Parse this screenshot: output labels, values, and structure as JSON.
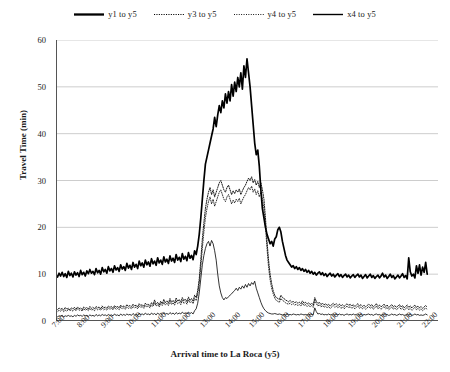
{
  "chart_data": {
    "type": "line",
    "title": "",
    "xlabel": "Arrival time to La Roca (y5)",
    "ylabel": "Travel Time (min)",
    "xlim": [
      7,
      22.5
    ],
    "ylim": [
      0,
      60
    ],
    "yticks": [
      0,
      10,
      20,
      30,
      40,
      50,
      60
    ],
    "xticks": [
      "7:00",
      "8:00",
      "9:00",
      "10:00",
      "11:00",
      "12:00",
      "13:00",
      "14:00",
      "15:00",
      "16:00",
      "17:00",
      "18:00",
      "19:00",
      "20:00",
      "21:00",
      "22:00"
    ],
    "grid": "horizontal",
    "legend_position": "top-center",
    "x_start": 7.0,
    "x_step": 0.0625,
    "series": [
      {
        "name": "y1 to y5",
        "style": "solid-thick",
        "color": "#000000",
        "values": [
          9.8,
          9.4,
          10.2,
          9.6,
          10.4,
          9.5,
          10.1,
          9.3,
          10.6,
          9.7,
          10.2,
          9.4,
          10.5,
          9.8,
          10.3,
          9.5,
          10.8,
          9.9,
          10.4,
          9.6,
          10.7,
          10.1,
          11.0,
          10.2,
          10.6,
          9.9,
          11.2,
          10.3,
          10.8,
          10.0,
          11.4,
          10.5,
          11.0,
          10.2,
          11.6,
          10.7,
          11.2,
          10.4,
          11.8,
          10.9,
          11.4,
          10.6,
          12.0,
          11.1,
          11.6,
          10.8,
          12.3,
          11.3,
          11.9,
          11.0,
          12.5,
          11.5,
          12.1,
          11.2,
          12.8,
          11.8,
          12.4,
          11.5,
          13.0,
          12.0,
          12.6,
          11.7,
          13.3,
          12.2,
          12.8,
          11.9,
          13.5,
          12.4,
          13.0,
          12.1,
          13.7,
          12.6,
          13.2,
          12.3,
          13.9,
          12.8,
          13.4,
          12.5,
          14.2,
          13.0,
          13.6,
          12.7,
          14.4,
          13.2,
          13.8,
          12.9,
          14.6,
          13.4,
          14.0,
          13.1,
          15.0,
          14.2,
          16.0,
          18.5,
          22.0,
          26.0,
          30.0,
          33.5,
          35.0,
          36.5,
          38.0,
          39.5,
          41.0,
          43.5,
          41.5,
          44.0,
          46.0,
          44.5,
          47.0,
          45.5,
          48.5,
          46.5,
          49.0,
          47.0,
          50.5,
          48.0,
          51.0,
          49.0,
          52.0,
          50.0,
          53.0,
          49.5,
          54.5,
          52.0,
          56.0,
          53.0,
          50.0,
          46.0,
          42.0,
          38.0,
          35.5,
          36.5,
          33.0,
          28.0,
          24.0,
          22.0,
          20.0,
          18.5,
          17.5,
          16.5,
          17.0,
          16.0,
          17.5,
          18.0,
          19.5,
          20.0,
          19.0,
          17.0,
          15.5,
          14.0,
          13.0,
          12.5,
          12.0,
          11.5,
          11.8,
          11.2,
          11.6,
          11.0,
          11.4,
          10.8,
          11.2,
          10.6,
          11.0,
          10.4,
          10.8,
          10.2,
          10.6,
          10.0,
          10.4,
          9.8,
          10.2,
          10.5,
          9.9,
          10.3,
          9.7,
          10.1,
          9.5,
          9.9,
          10.2,
          9.6,
          10.0,
          9.4,
          9.8,
          10.1,
          9.5,
          9.9,
          9.3,
          9.7,
          10.0,
          9.4,
          9.8,
          9.2,
          9.6,
          9.9,
          9.3,
          9.7,
          10.0,
          9.4,
          9.8,
          9.1,
          9.5,
          9.9,
          9.2,
          9.6,
          10.0,
          9.3,
          9.7,
          9.1,
          9.5,
          9.8,
          9.2,
          9.6,
          10.2,
          9.4,
          9.8,
          9.1,
          9.5,
          10.0,
          9.3,
          9.7,
          9.0,
          9.4,
          9.8,
          9.2,
          9.6,
          10.1,
          9.3,
          9.7,
          9.0,
          13.5,
          10.5,
          9.6,
          10.0,
          9.2,
          11.8,
          10.2,
          12.0,
          9.8,
          11.5,
          10.4,
          12.5,
          10.0
        ]
      },
      {
        "name": "y3 to y5",
        "style": "dotted",
        "color": "#000000",
        "values": [
          2.6,
          2.4,
          2.8,
          2.5,
          2.7,
          2.3,
          2.9,
          2.5,
          2.7,
          2.4,
          2.8,
          2.6,
          2.9,
          2.5,
          3.0,
          2.6,
          2.8,
          2.4,
          3.0,
          2.7,
          2.9,
          2.5,
          3.1,
          2.7,
          2.9,
          2.6,
          3.1,
          2.8,
          3.0,
          2.6,
          3.2,
          2.8,
          3.0,
          2.7,
          3.2,
          2.9,
          3.1,
          2.7,
          3.3,
          2.9,
          3.1,
          2.8,
          3.4,
          3.0,
          3.2,
          2.9,
          3.5,
          3.1,
          3.3,
          3.0,
          3.6,
          3.2,
          3.4,
          3.0,
          3.7,
          3.3,
          3.5,
          3.1,
          3.8,
          3.4,
          3.6,
          3.2,
          3.9,
          3.5,
          4.5,
          3.6,
          4.0,
          3.4,
          4.2,
          3.7,
          4.6,
          3.9,
          4.3,
          3.8,
          4.8,
          4.0,
          4.4,
          3.9,
          4.9,
          4.2,
          4.6,
          4.0,
          5.0,
          4.3,
          4.7,
          4.1,
          5.1,
          4.4,
          4.8,
          4.2,
          5.5,
          5.0,
          6.5,
          9.0,
          13.0,
          17.5,
          21.0,
          24.0,
          26.0,
          27.5,
          28.5,
          27.0,
          28.0,
          26.5,
          27.5,
          28.5,
          29.5,
          30.0,
          29.0,
          28.0,
          27.5,
          28.5,
          29.0,
          28.0,
          27.0,
          27.8,
          27.2,
          28.0,
          27.5,
          28.2,
          27.0,
          27.8,
          28.5,
          29.0,
          29.8,
          30.5,
          30.0,
          30.8,
          29.5,
          30.2,
          29.0,
          29.8,
          28.5,
          29.5,
          28.0,
          26.0,
          22.0,
          17.0,
          13.0,
          10.0,
          8.0,
          6.5,
          5.5,
          5.0,
          4.8,
          4.6,
          5.5,
          5.0,
          4.8,
          4.5,
          4.3,
          4.1,
          4.4,
          4.0,
          4.2,
          3.9,
          4.1,
          3.8,
          4.0,
          3.7,
          4.3,
          3.8,
          4.0,
          3.6,
          3.9,
          3.5,
          3.8,
          3.4,
          5.0,
          4.2,
          3.7,
          4.0,
          3.5,
          3.8,
          3.4,
          3.7,
          3.3,
          3.6,
          3.2,
          3.5,
          3.8,
          3.4,
          3.7,
          3.3,
          3.6,
          3.2,
          3.5,
          3.1,
          3.4,
          3.7,
          3.3,
          3.6,
          3.2,
          3.5,
          3.1,
          3.4,
          3.7,
          3.2,
          3.5,
          3.1,
          3.4,
          3.0,
          3.3,
          3.6,
          3.2,
          3.5,
          3.0,
          3.3,
          3.7,
          3.1,
          3.4,
          3.0,
          3.3,
          3.6,
          3.1,
          3.4,
          2.9,
          3.2,
          3.5,
          3.0,
          3.3,
          2.9,
          3.2,
          3.5,
          3.0,
          3.3,
          2.8,
          3.1,
          3.4,
          2.9,
          3.2,
          2.8,
          3.1,
          3.4,
          2.9,
          3.2,
          2.8,
          3.1,
          2.7,
          3.0,
          3.3,
          2.9
        ]
      },
      {
        "name": "y4 to y5",
        "style": "dotted-fine",
        "color": "#000000",
        "values": [
          2.2,
          2.0,
          2.3,
          2.1,
          2.4,
          2.0,
          2.3,
          2.1,
          2.5,
          2.2,
          2.4,
          2.1,
          2.5,
          2.2,
          2.6,
          2.3,
          2.4,
          2.1,
          2.6,
          2.3,
          2.5,
          2.2,
          2.7,
          2.3,
          2.5,
          2.2,
          2.7,
          2.4,
          2.6,
          2.3,
          2.8,
          2.4,
          2.6,
          2.3,
          2.8,
          2.5,
          2.7,
          2.4,
          2.9,
          2.5,
          2.7,
          2.4,
          3.0,
          2.6,
          2.8,
          2.5,
          3.0,
          2.7,
          2.9,
          2.6,
          3.1,
          2.8,
          3.0,
          2.6,
          3.2,
          2.9,
          3.1,
          2.7,
          3.3,
          3.0,
          3.2,
          2.8,
          3.4,
          3.1,
          3.9,
          3.2,
          3.5,
          3.0,
          3.7,
          3.3,
          4.0,
          3.4,
          3.8,
          3.3,
          4.2,
          3.5,
          3.9,
          3.4,
          4.3,
          3.7,
          4.0,
          3.5,
          4.4,
          3.8,
          4.1,
          3.6,
          4.5,
          3.9,
          4.2,
          3.7,
          4.8,
          4.4,
          5.8,
          8.0,
          11.5,
          15.5,
          19.0,
          22.0,
          24.0,
          25.5,
          26.5,
          25.0,
          26.0,
          24.5,
          25.5,
          26.5,
          27.5,
          28.0,
          27.0,
          26.0,
          25.5,
          26.5,
          27.0,
          26.0,
          25.0,
          25.8,
          25.2,
          26.0,
          25.5,
          26.2,
          25.0,
          25.8,
          26.5,
          27.0,
          27.8,
          28.5,
          28.0,
          28.8,
          27.5,
          28.2,
          27.0,
          27.8,
          26.5,
          27.5,
          26.0,
          24.0,
          20.0,
          15.5,
          11.5,
          8.8,
          7.0,
          5.8,
          4.9,
          4.4,
          4.2,
          4.0,
          4.8,
          4.4,
          4.2,
          3.9,
          3.7,
          3.6,
          3.8,
          3.5,
          3.7,
          3.4,
          3.6,
          3.3,
          3.5,
          3.2,
          3.8,
          3.3,
          3.5,
          3.1,
          3.4,
          3.0,
          3.3,
          2.9,
          4.4,
          3.7,
          3.2,
          3.5,
          3.0,
          3.3,
          2.9,
          3.2,
          2.8,
          3.1,
          2.7,
          3.0,
          3.3,
          2.9,
          3.2,
          2.8,
          3.1,
          2.7,
          3.0,
          2.6,
          2.9,
          3.2,
          2.8,
          3.1,
          2.7,
          3.0,
          2.6,
          2.9,
          3.2,
          2.7,
          3.0,
          2.6,
          2.9,
          2.5,
          2.8,
          3.1,
          2.7,
          3.0,
          2.5,
          2.8,
          3.2,
          2.6,
          2.9,
          2.5,
          2.8,
          3.1,
          2.6,
          2.9,
          2.4,
          2.7,
          3.0,
          2.5,
          2.8,
          2.4,
          2.7,
          3.0,
          2.5,
          2.8,
          2.3,
          2.6,
          2.9,
          2.4,
          2.7,
          2.3,
          2.6,
          2.9,
          2.4,
          2.7,
          2.3,
          2.6,
          2.2,
          2.5,
          2.8,
          2.4
        ]
      },
      {
        "name": "x4 to y5",
        "style": "solid-thin",
        "color": "#000000",
        "values": [
          1.0,
          0.9,
          1.1,
          1.0,
          1.2,
          0.9,
          1.1,
          1.0,
          1.2,
          1.0,
          1.1,
          0.9,
          1.2,
          1.0,
          1.3,
          1.1,
          1.2,
          1.0,
          1.3,
          1.1,
          1.2,
          1.0,
          1.3,
          1.1,
          1.2,
          1.0,
          1.4,
          1.1,
          1.3,
          1.1,
          1.4,
          1.2,
          1.3,
          1.1,
          1.4,
          1.2,
          1.3,
          1.1,
          1.5,
          1.2,
          1.3,
          1.1,
          1.5,
          1.2,
          1.4,
          1.2,
          1.5,
          1.3,
          1.4,
          1.2,
          1.6,
          1.3,
          1.5,
          1.2,
          1.6,
          1.4,
          1.5,
          1.3,
          1.7,
          1.4,
          1.5,
          1.3,
          1.7,
          1.4,
          1.6,
          1.3,
          1.7,
          1.4,
          1.6,
          1.4,
          1.8,
          1.5,
          1.6,
          1.4,
          1.8,
          1.5,
          1.7,
          1.4,
          1.8,
          1.5,
          1.7,
          1.5,
          1.9,
          1.6,
          1.7,
          1.5,
          1.9,
          1.6,
          1.8,
          1.5,
          2.2,
          2.6,
          3.8,
          6.0,
          9.0,
          12.0,
          14.0,
          15.5,
          16.5,
          17.0,
          16.0,
          17.2,
          16.5,
          15.0,
          13.0,
          10.0,
          7.5,
          6.0,
          5.0,
          4.5,
          5.0,
          4.8,
          5.2,
          5.5,
          5.8,
          6.2,
          6.5,
          7.0,
          6.5,
          7.2,
          6.8,
          7.5,
          7.0,
          7.8,
          7.2,
          8.0,
          7.5,
          8.2,
          7.8,
          8.5,
          7.0,
          6.0,
          5.0,
          4.0,
          3.2,
          2.6,
          2.2,
          1.9,
          1.7,
          1.6,
          1.5,
          1.5,
          1.6,
          1.5,
          1.4,
          1.5,
          1.4,
          1.3,
          1.4,
          1.3,
          1.5,
          1.3,
          1.4,
          1.3,
          1.5,
          1.4,
          1.3,
          1.4,
          1.3,
          1.5,
          1.4,
          1.3,
          1.4,
          1.3,
          1.5,
          1.3,
          1.4,
          1.3,
          2.8,
          2.0,
          1.5,
          1.6,
          1.4,
          1.5,
          1.3,
          1.4,
          1.3,
          1.5,
          1.3,
          1.4,
          1.5,
          1.3,
          1.4,
          1.3,
          1.5,
          1.3,
          1.4,
          1.2,
          1.4,
          1.5,
          1.3,
          1.4,
          1.3,
          1.5,
          1.3,
          1.4,
          1.5,
          1.3,
          1.4,
          1.2,
          1.4,
          1.3,
          1.4,
          1.5,
          1.3,
          1.4,
          1.2,
          1.4,
          1.5,
          1.3,
          1.4,
          1.2,
          1.4,
          1.5,
          1.3,
          1.4,
          1.2,
          1.3,
          1.5,
          1.3,
          1.4,
          1.2,
          1.3,
          1.5,
          1.3,
          1.4,
          1.2,
          1.3,
          1.5,
          1.3,
          1.4,
          1.2,
          1.3,
          1.5,
          1.3,
          1.4,
          1.2,
          1.3,
          1.2,
          1.3,
          1.5,
          1.3
        ]
      }
    ]
  }
}
